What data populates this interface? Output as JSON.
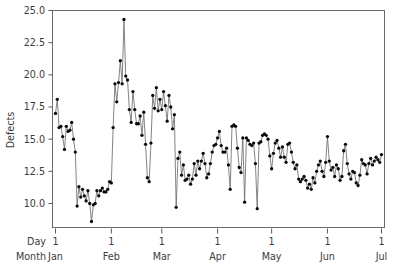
{
  "chart_data": {
    "type": "line",
    "title": "",
    "subtitle": "",
    "xlabel": "",
    "ylabel": "Defects",
    "ylim": [
      9.0,
      25.2
    ],
    "yticks": [
      10.0,
      12.5,
      15.0,
      17.5,
      20.0,
      22.5,
      25.0
    ],
    "ytick_labels": [
      "10.0",
      "12.5",
      "15.0",
      "17.5",
      "20.0",
      "22.5",
      "25.0"
    ],
    "grid": false,
    "legend": null,
    "markers": "filled-circle",
    "marker_color": "#0a0a0a",
    "line_color": "#6e6e70",
    "axis_rows": [
      {
        "name": "Day",
        "labels": [
          "1",
          "1",
          "1",
          "1",
          "1",
          "1",
          "1"
        ]
      },
      {
        "name": "Month",
        "labels": [
          "Jan",
          "Feb",
          "Mar",
          "Apr",
          "May",
          "Jun",
          "Jul"
        ]
      }
    ],
    "xtick_positions_index": [
      0,
      31,
      59,
      90,
      120,
      151,
      181
    ],
    "x_index_range": [
      0,
      181
    ],
    "series": [
      {
        "name": "Defects",
        "values": [
          17.0,
          18.1,
          15.9,
          16.0,
          15.2,
          14.2,
          16.0,
          15.6,
          15.7,
          16.3,
          15.0,
          14.0,
          9.8,
          11.3,
          10.5,
          11.1,
          10.6,
          10.2,
          11.0,
          10.0,
          8.6,
          9.9,
          10.0,
          11.0,
          10.6,
          11.0,
          11.2,
          10.9,
          10.9,
          11.1,
          11.7,
          11.6,
          15.9,
          19.3,
          17.9,
          19.4,
          21.1,
          19.3,
          24.3,
          19.9,
          19.6,
          17.3,
          16.3,
          18.7,
          17.3,
          16.2,
          16.2,
          16.8,
          15.3,
          17.1,
          14.6,
          12.0,
          11.7,
          14.7,
          18.4,
          17.4,
          19.0,
          17.2,
          18.1,
          17.3,
          18.7,
          17.6,
          16.4,
          18.4,
          17.5,
          15.8,
          16.9,
          9.7,
          13.5,
          14.0,
          12.2,
          13.0,
          11.8,
          11.9,
          12.2,
          11.5,
          11.9,
          13.1,
          12.2,
          13.3,
          12.7,
          13.3,
          13.9,
          13.1,
          12.0,
          12.3,
          13.1,
          14.0,
          14.5,
          14.6,
          15.1,
          15.6,
          14.5,
          14.0,
          14.0,
          14.3,
          13.0,
          11.1,
          16.0,
          16.1,
          16.0,
          14.3,
          12.8,
          12.4,
          15.1,
          10.1,
          15.1,
          14.9,
          14.6,
          14.5,
          14.7,
          13.1,
          9.6,
          14.7,
          14.8,
          15.3,
          15.4,
          15.3,
          15.0,
          13.7,
          12.7,
          13.9,
          14.7,
          14.9,
          14.3,
          13.6,
          14.4,
          13.6,
          13.2,
          14.6,
          14.7,
          14.0,
          13.2,
          12.7,
          13.0,
          11.9,
          11.7,
          11.9,
          12.1,
          11.8,
          11.2,
          11.5,
          11.1,
          12.0,
          11.6,
          12.5,
          13.0,
          13.3,
          12.5,
          12.1,
          13.2,
          15.2,
          13.3,
          12.6,
          12.8,
          12.1,
          13.0,
          12.7,
          11.8,
          12.1,
          14.1,
          14.6,
          13.1,
          12.3,
          11.9,
          12.5,
          12.4,
          11.6,
          11.4,
          12.2,
          13.4,
          13.1,
          13.0,
          12.3,
          13.1,
          13.5,
          13.0,
          13.3,
          13.6,
          13.4,
          13.2,
          13.8
        ]
      }
    ]
  },
  "plot_geometry": {
    "left": 52,
    "right": 385,
    "top": 10,
    "bottom": 228
  }
}
